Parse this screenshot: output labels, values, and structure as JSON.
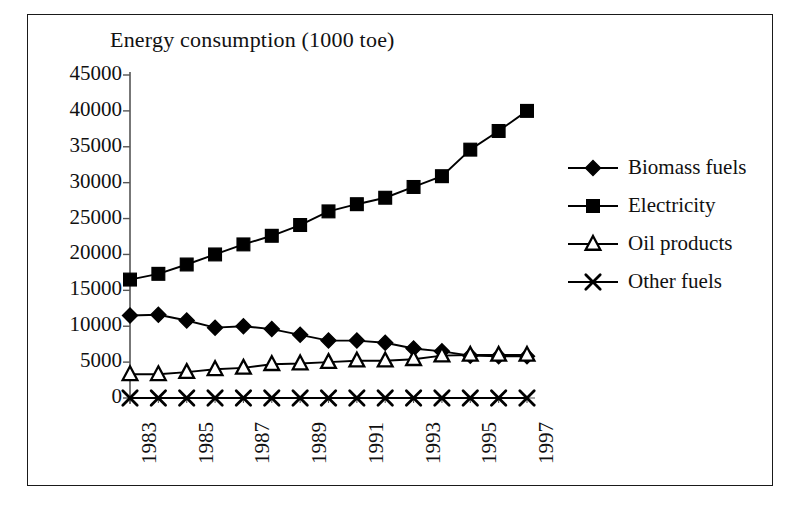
{
  "figure": {
    "title": "Energy consumption (1000 toe)",
    "frame_color": "#1a1a1a",
    "background": "#ffffff",
    "ink_color": "#000000"
  },
  "chart_data": {
    "type": "line",
    "title": "Energy consumption (1000 toe)",
    "xlabel": "",
    "ylabel": "",
    "ylim": [
      0,
      45000
    ],
    "ytick_labels": [
      "0",
      "5000",
      "10000",
      "15000",
      "20000",
      "25000",
      "30000",
      "35000",
      "40000",
      "45000"
    ],
    "ytick_values": [
      0,
      5000,
      10000,
      15000,
      20000,
      25000,
      30000,
      35000,
      40000,
      45000
    ],
    "grid": false,
    "legend_position": "right",
    "x": [
      1983,
      1984,
      1985,
      1986,
      1987,
      1988,
      1989,
      1990,
      1991,
      1992,
      1993,
      1994,
      1995,
      1996,
      1997
    ],
    "xtick_labels": [
      "1983",
      "1985",
      "1987",
      "1989",
      "1991",
      "1993",
      "1995",
      "1997"
    ],
    "xtick_values": [
      1983,
      1985,
      1987,
      1989,
      1991,
      1993,
      1995,
      1997
    ],
    "xtick_rotation": 90,
    "series": [
      {
        "name": "Biomass fuels",
        "marker": "filled-diamond",
        "color": "#000000",
        "values": [
          11500,
          11600,
          10800,
          9800,
          10000,
          9600,
          8800,
          8000,
          8000,
          7700,
          6900,
          6500,
          5900,
          5800,
          5800
        ]
      },
      {
        "name": "Electricity",
        "marker": "filled-square",
        "color": "#000000",
        "values": [
          16500,
          17300,
          18600,
          20000,
          21400,
          22600,
          24100,
          26000,
          27000,
          27900,
          29400,
          30900,
          34600,
          37200,
          40000
        ]
      },
      {
        "name": "Oil products",
        "marker": "open-triangle",
        "color": "#000000",
        "values": [
          3300,
          3300,
          3600,
          4000,
          4200,
          4700,
          4800,
          5000,
          5200,
          5200,
          5400,
          5900,
          6000,
          6000,
          6000
        ]
      },
      {
        "name": "Other fuels",
        "marker": "cross",
        "color": "#000000",
        "values": [
          0,
          0,
          0,
          0,
          0,
          0,
          0,
          0,
          0,
          0,
          0,
          0,
          0,
          0,
          0
        ]
      }
    ]
  },
  "legend": {
    "items": [
      {
        "label": "Biomass fuels",
        "marker": "filled-diamond"
      },
      {
        "label": "Electricity",
        "marker": "filled-square"
      },
      {
        "label": "Oil products",
        "marker": "open-triangle"
      },
      {
        "label": "Other fuels",
        "marker": "cross"
      }
    ]
  }
}
